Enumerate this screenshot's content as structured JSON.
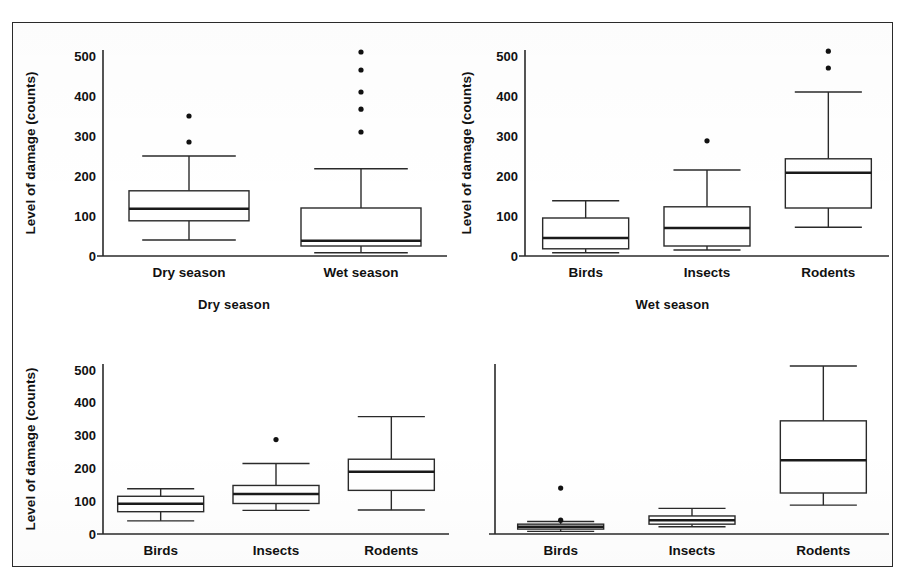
{
  "figure": {
    "ylabel": "Level of damage (counts)",
    "y_ticks": [
      "0",
      "100",
      "200",
      "300",
      "400",
      "500"
    ],
    "ylim": [
      0,
      530
    ],
    "panel_titles": {
      "bottom_left": "Dry season",
      "bottom_right": "Wet season"
    }
  },
  "chart_data": [
    {
      "id": "panel-top-left",
      "type": "box",
      "title": "",
      "xlabel": "",
      "ylabel": "Level of damage (counts)",
      "ylim": [
        0,
        530
      ],
      "yticks": [
        0,
        100,
        200,
        300,
        400,
        500
      ],
      "grid": false,
      "legend": "none",
      "categories": [
        "Dry season",
        "Wet season"
      ],
      "boxes": [
        {
          "category": "Dry season",
          "whisker_low": 40,
          "q1": 88,
          "median": 118,
          "q3": 163,
          "whisker_high": 250,
          "outliers": [
            285,
            350
          ]
        },
        {
          "category": "Wet season",
          "whisker_low": 8,
          "q1": 25,
          "median": 38,
          "q3": 120,
          "whisker_high": 218,
          "outliers": [
            310,
            367,
            410,
            465,
            510
          ]
        }
      ]
    },
    {
      "id": "panel-top-right",
      "type": "box",
      "title": "",
      "xlabel": "",
      "ylabel": "Level of damage (counts)",
      "ylim": [
        0,
        530
      ],
      "yticks": [
        0,
        100,
        200,
        300,
        400,
        500
      ],
      "grid": false,
      "legend": "none",
      "categories": [
        "Birds",
        "Insects",
        "Rodents"
      ],
      "boxes": [
        {
          "category": "Birds",
          "whisker_low": 8,
          "q1": 18,
          "median": 45,
          "q3": 95,
          "whisker_high": 138,
          "outliers": []
        },
        {
          "category": "Insects",
          "whisker_low": 15,
          "q1": 25,
          "median": 70,
          "q3": 123,
          "whisker_high": 215,
          "outliers": [
            288
          ]
        },
        {
          "category": "Rodents",
          "whisker_low": 72,
          "q1": 120,
          "median": 208,
          "q3": 243,
          "whisker_high": 410,
          "outliers": [
            470,
            512
          ]
        }
      ]
    },
    {
      "id": "panel-bottom-left",
      "type": "box",
      "title": "Dry season",
      "xlabel": "",
      "ylabel": "Level of damage (counts)",
      "ylim": [
        0,
        530
      ],
      "yticks": [
        0,
        100,
        200,
        300,
        400,
        500
      ],
      "grid": false,
      "legend": "none",
      "categories": [
        "Birds",
        "Insects",
        "Rodents"
      ],
      "boxes": [
        {
          "category": "Birds",
          "whisker_low": 40,
          "q1": 68,
          "median": 92,
          "q3": 115,
          "whisker_high": 138,
          "outliers": []
        },
        {
          "category": "Insects",
          "whisker_low": 72,
          "q1": 93,
          "median": 122,
          "q3": 148,
          "whisker_high": 215,
          "outliers": [
            288
          ]
        },
        {
          "category": "Rodents",
          "whisker_low": 73,
          "q1": 133,
          "median": 190,
          "q3": 228,
          "whisker_high": 358,
          "outliers": []
        }
      ]
    },
    {
      "id": "panel-bottom-right",
      "type": "box",
      "title": "Wet season",
      "xlabel": "",
      "ylabel": "Level of damage (counts)",
      "ylim": [
        0,
        530
      ],
      "yticks": [
        0,
        100,
        200,
        300,
        400,
        500
      ],
      "grid": false,
      "legend": "none",
      "categories": [
        "Birds",
        "Insects",
        "Rodents"
      ],
      "boxes": [
        {
          "category": "Birds",
          "whisker_low": 8,
          "q1": 15,
          "median": 22,
          "q3": 30,
          "whisker_high": 38,
          "outliers": [
            42,
            140
          ]
        },
        {
          "category": "Insects",
          "whisker_low": 22,
          "q1": 30,
          "median": 42,
          "q3": 55,
          "whisker_high": 78,
          "outliers": []
        },
        {
          "category": "Rodents",
          "whisker_low": 88,
          "q1": 125,
          "median": 225,
          "q3": 345,
          "whisker_high": 512,
          "outliers": []
        }
      ]
    }
  ]
}
